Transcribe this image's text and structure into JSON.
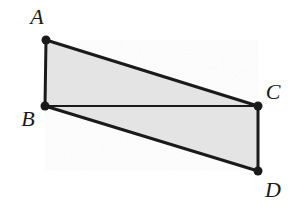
{
  "figure": {
    "background_color": "#ffffff",
    "fill_color": "#e4e4e4",
    "stroke_color": "#1a1a1a",
    "vertex_dot_color": "#1a1a1a",
    "outer_stroke_width": 3,
    "diagonal_stroke_width": 2,
    "vertex_dot_radius": 4.5,
    "width": 290,
    "height": 212
  },
  "vertices": [
    {
      "id": "A",
      "label": "A",
      "x": 46,
      "y": 40,
      "label_x": 37,
      "label_y": 17
    },
    {
      "id": "B",
      "label": "B",
      "x": 45,
      "y": 106,
      "label_x": 28,
      "label_y": 119
    },
    {
      "id": "C",
      "label": "C",
      "x": 258,
      "y": 106,
      "label_x": 273,
      "label_y": 92
    },
    {
      "id": "D",
      "label": "D",
      "x": 258,
      "y": 171,
      "label_x": 273,
      "label_y": 190
    }
  ],
  "edges": [
    {
      "id": "AB",
      "from": "A",
      "to": "B",
      "kind": "outer"
    },
    {
      "id": "AC",
      "from": "A",
      "to": "C",
      "kind": "outer"
    },
    {
      "id": "BD",
      "from": "B",
      "to": "D",
      "kind": "outer"
    },
    {
      "id": "CD",
      "from": "C",
      "to": "D",
      "kind": "outer"
    },
    {
      "id": "BC",
      "from": "B",
      "to": "C",
      "kind": "diagonal"
    }
  ],
  "regions": [
    {
      "id": "upper-triangle",
      "vertices": [
        "A",
        "B",
        "C"
      ],
      "shaded": true
    },
    {
      "id": "lower-triangle",
      "vertices": [
        "B",
        "D",
        "C"
      ],
      "shaded": true
    }
  ]
}
